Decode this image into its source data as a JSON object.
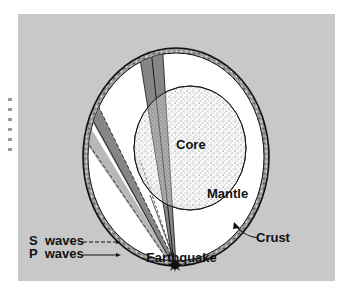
{
  "diagram": {
    "labels": {
      "core": "Core",
      "mantle": "Mantle",
      "crust": "Crust",
      "earthquake": "Earthquake"
    },
    "legend": [
      {
        "label": "S  waves",
        "line_style": "dashed"
      },
      {
        "label": "P  waves",
        "line_style": "solid"
      }
    ],
    "layers": [
      {
        "name": "Crust",
        "fill": "stippled-band"
      },
      {
        "name": "Mantle",
        "fill": "#ffffff"
      },
      {
        "name": "Core",
        "fill": "stippled"
      }
    ],
    "colors": {
      "background_panel": "#c8c8c8",
      "wave_wedge": "#7a7a7a",
      "outline": "#1a1a1a"
    }
  }
}
